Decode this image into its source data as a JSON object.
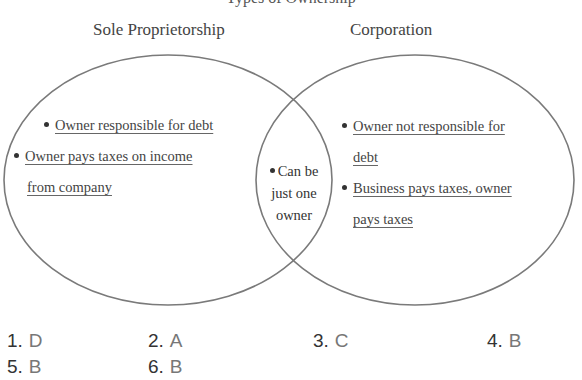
{
  "diagram": {
    "type": "venn",
    "cut_off_title": "Types of Ownership",
    "sets": [
      {
        "heading": "Sole Proprietorship",
        "items": [
          "Owner responsible for debt",
          "Owner pays taxes on income",
          "from company"
        ]
      },
      {
        "heading": "Corporation",
        "items": [
          "Owner not responsible for",
          "debt",
          "Business pays taxes, owner",
          "pays taxes"
        ]
      }
    ],
    "overlap": {
      "lines": [
        "Can be",
        "just one",
        "owner"
      ]
    },
    "colors": {
      "outline": "#777777",
      "text": "#444444"
    }
  },
  "answers": [
    {
      "num": "1.",
      "letter": "D"
    },
    {
      "num": "2.",
      "letter": "A"
    },
    {
      "num": "3.",
      "letter": "C"
    },
    {
      "num": "4.",
      "letter": "B"
    },
    {
      "num": "5.",
      "letter": "B"
    },
    {
      "num": "6.",
      "letter": "B"
    }
  ]
}
